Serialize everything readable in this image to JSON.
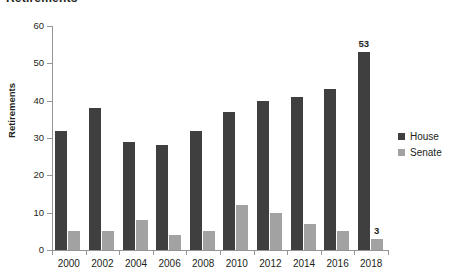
{
  "chart_data": {
    "type": "bar",
    "title": "Retirements",
    "xlabel": "",
    "ylabel": "Retirements",
    "categories": [
      "2000",
      "2002",
      "2004",
      "2006",
      "2008",
      "2010",
      "2012",
      "2014",
      "2016",
      "2018"
    ],
    "series": [
      {
        "name": "House",
        "color": "#3f3f3f",
        "values": [
          32,
          38,
          29,
          28,
          32,
          37,
          40,
          41,
          43,
          53
        ]
      },
      {
        "name": "Senate",
        "color": "#a2a2a2",
        "values": [
          5,
          5,
          8,
          4,
          5,
          12,
          10,
          7,
          5,
          3
        ]
      }
    ],
    "ylim": [
      0,
      60
    ],
    "ytick_values": [
      0,
      10,
      20,
      30,
      40,
      50,
      60
    ],
    "ytick_labels": [
      "0",
      "10",
      "20",
      "30",
      "40",
      "50",
      "60"
    ],
    "grid": false,
    "legend_position": "right",
    "annotations": [
      {
        "text": "53",
        "series": "House",
        "category": "2018"
      },
      {
        "text": "3",
        "series": "Senate",
        "category": "2018"
      }
    ]
  },
  "legend": {
    "items": [
      {
        "label": "House",
        "color": "#3f3f3f"
      },
      {
        "label": "Senate",
        "color": "#a2a2a2"
      }
    ]
  },
  "axes": {
    "y_title": "Retirements",
    "y_labels": [
      "60",
      "50",
      "40",
      "30",
      "20",
      "10",
      "0"
    ],
    "x_labels": [
      "2000",
      "2002",
      "2004",
      "2006",
      "2008",
      "2010",
      "2012",
      "2014",
      "2016",
      "2018"
    ]
  },
  "labels": {
    "house_2018": "53",
    "senate_2018": "3"
  }
}
